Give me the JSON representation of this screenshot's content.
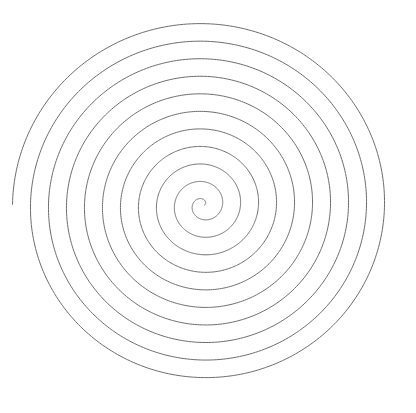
{
  "canvas": {
    "width": 416,
    "height": 413,
    "background_color": "#ffffff"
  },
  "figure": {
    "name": "archimedean-spiral"
  },
  "chart_data": {
    "type": "line",
    "title": "",
    "subtitle": "",
    "xlabel": "",
    "ylabel": "",
    "grid": false,
    "legend": null,
    "axis_visible": false,
    "tick_labels": [],
    "annotations": [],
    "curve": {
      "kind": "archimedean_spiral",
      "equation": "r = a + b * theta",
      "center": {
        "x": 203,
        "y": 205
      },
      "a": 1.5,
      "b_px_per_radian": 2.865,
      "turn_spacing_px": 18,
      "turns": 10.5,
      "theta_start_rad": 0,
      "theta_end_rad": 65.97,
      "direction": "counterclockwise",
      "start_point": {
        "x": 203,
        "y": 202
      },
      "end_point": {
        "x": 392,
        "y": 204
      },
      "x_scale": 1.0,
      "y_scale": 0.975,
      "bounds": {
        "left": 20,
        "top": 24,
        "right": 392,
        "bottom": 389
      }
    },
    "stroke": {
      "color": "#6e6e6e",
      "width_px": 1,
      "linecap": "round",
      "fill": "none"
    },
    "crossings_on_horizontal_through_center": {
      "left_of_center_x": [
        20,
        38,
        56,
        74,
        92,
        110,
        128,
        146,
        163,
        180
      ],
      "right_of_center_x": [
        212,
        230,
        248,
        265,
        283,
        300,
        318,
        336,
        354,
        372,
        390
      ]
    },
    "crossings_on_vertical_through_center": {
      "above_center_y": [
        24,
        42,
        59,
        77,
        94,
        112,
        129,
        147,
        164,
        182
      ],
      "below_center_y": [
        214,
        232,
        250,
        267,
        285,
        302,
        320,
        337,
        355,
        372,
        389
      ]
    }
  }
}
